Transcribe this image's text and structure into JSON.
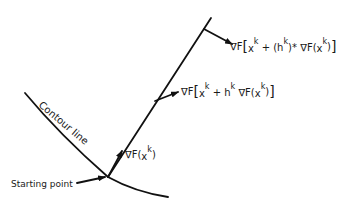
{
  "diagram": {
    "type": "steepest-ascent gradient diagram",
    "labels": {
      "contour_line": "Contour line",
      "starting_point": "Starting point",
      "grad_start": {
        "nabla": "∇F",
        "open": "(",
        "x": "x",
        "sup": "k",
        "close": ")"
      },
      "grad_step": {
        "nabla": "∇F",
        "lb": "[",
        "x": "x",
        "sup1": "k",
        "plus": " + h",
        "sup2": "k",
        "mid": "  ∇F",
        "open": "(",
        "x2": "x",
        "sup3": "k",
        "close": ")",
        "rb": "]"
      },
      "grad_opt": {
        "nabla": "∇F",
        "lb": "[",
        "x": "x",
        "sup1": "k",
        "plus": " + (h",
        "sup2": "k",
        "star": ")*",
        "mid": " ∇F",
        "open": "(",
        "x2": "x",
        "sup3": "k",
        "close": ")",
        "rb": "]"
      }
    },
    "colors": {
      "ink": "#111111",
      "background": "#ffffff"
    }
  }
}
